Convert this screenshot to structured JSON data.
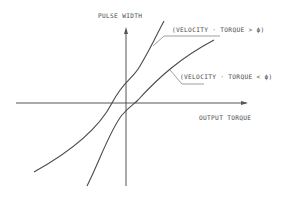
{
  "diagram": {
    "y_axis_label": "PULSE WIDTH",
    "x_axis_label": "OUTPUT TORQUE",
    "curves": [
      {
        "label": "(VELOCITY · TORQUE > ϕ)",
        "name": "upper-curve"
      },
      {
        "label": "(VELOCITY · TORQUE < ϕ)",
        "name": "lower-curve"
      }
    ],
    "colors": {
      "line": "#4a4a4a",
      "background": "#ffffff"
    }
  }
}
